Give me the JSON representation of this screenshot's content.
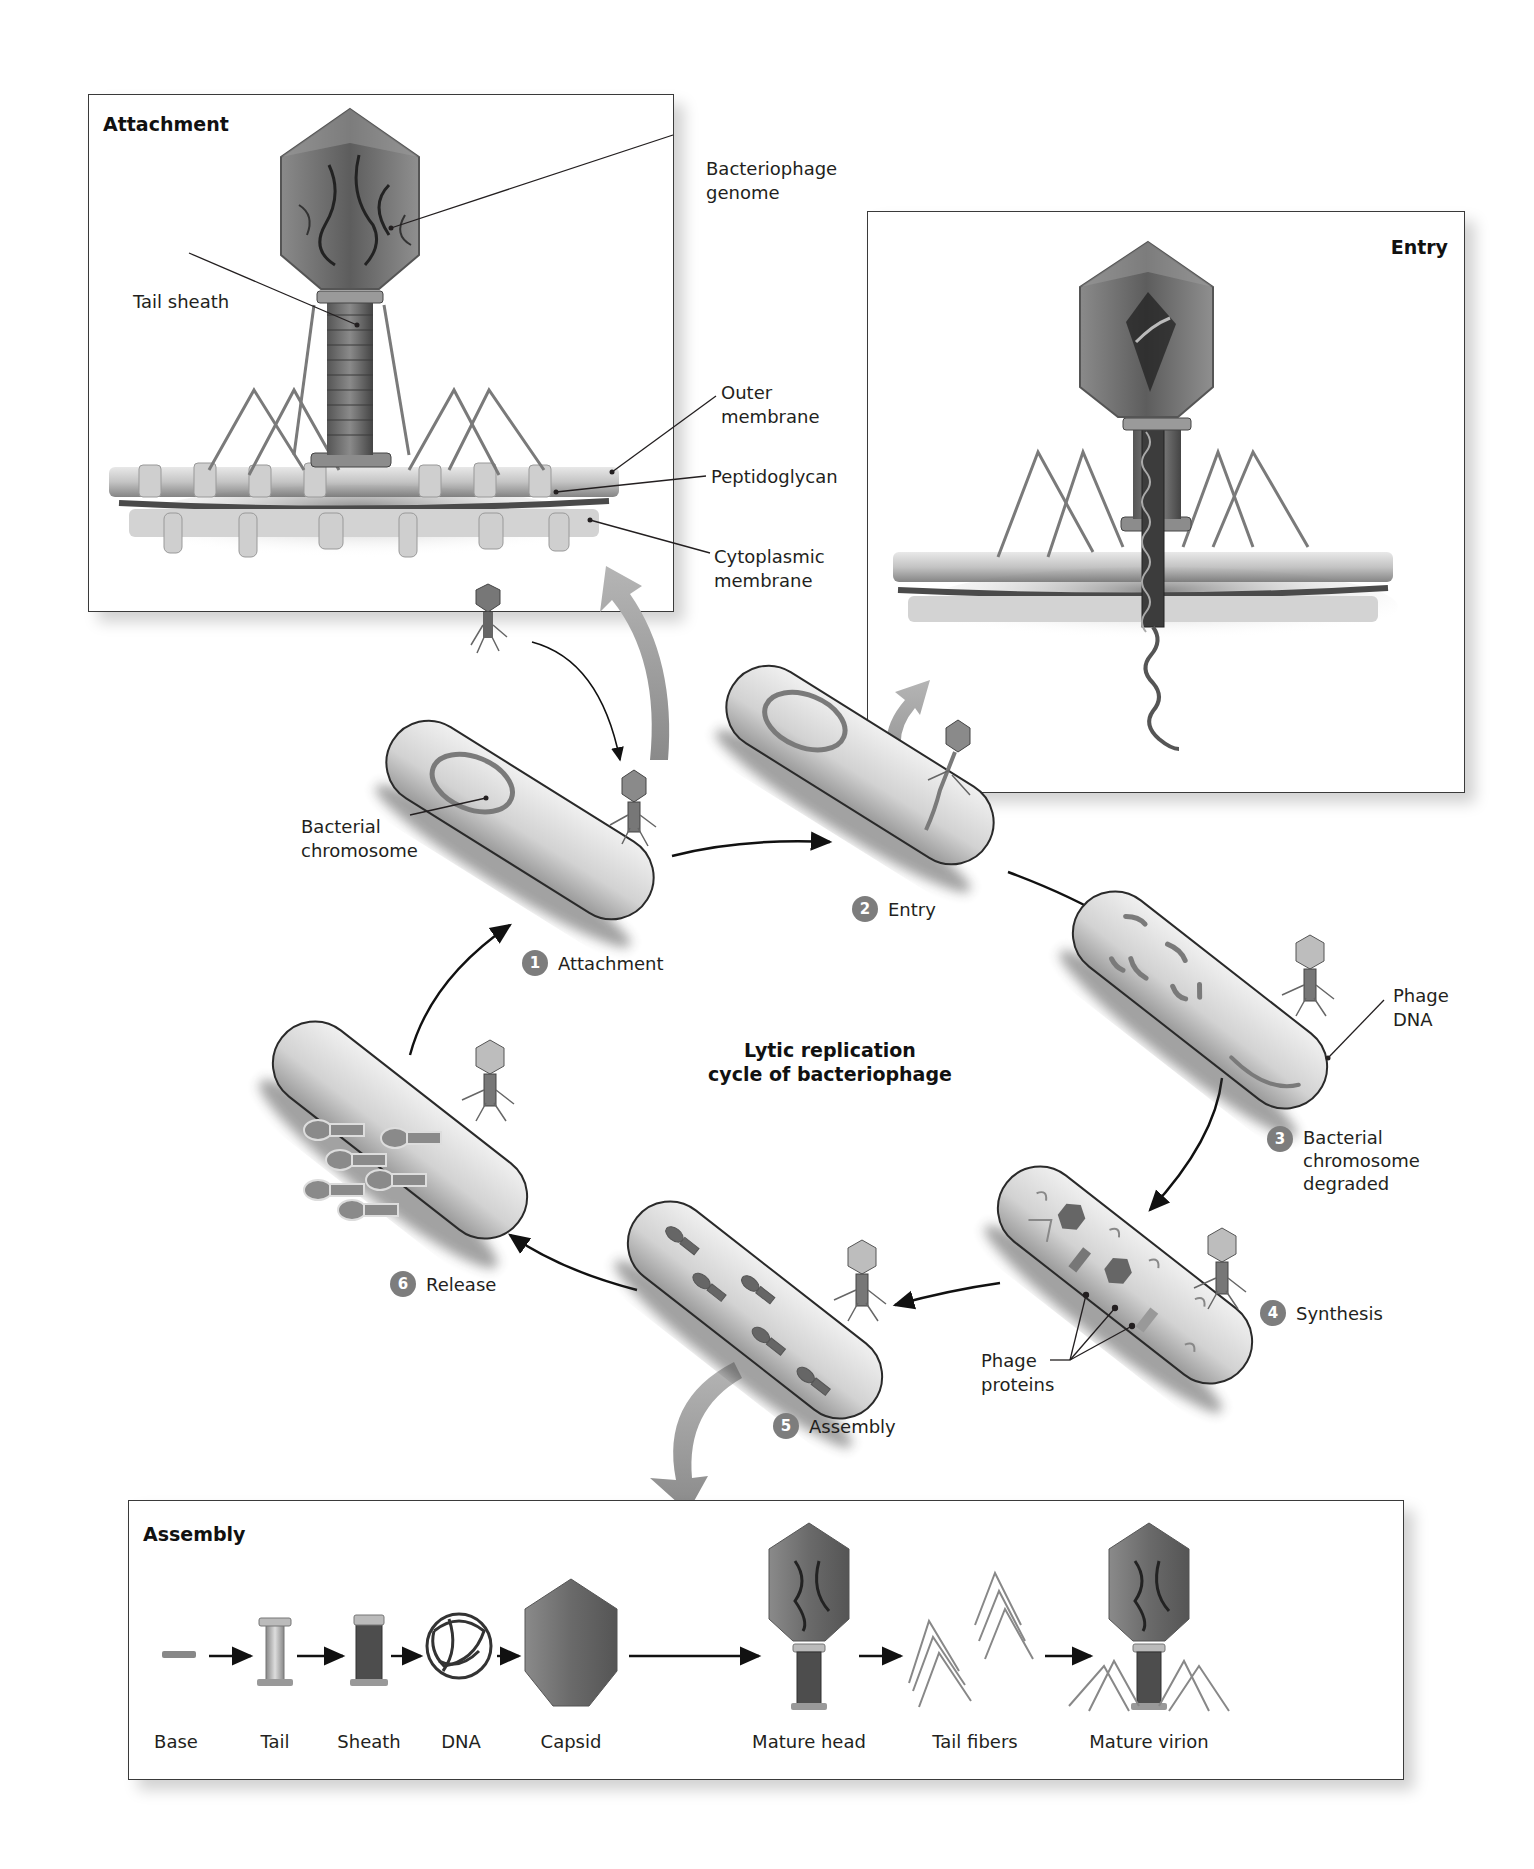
{
  "title": "Lytic replication cycle of bacteriophage",
  "title_lines": [
    "Lytic replication",
    "cycle of bacteriophage"
  ],
  "colors": {
    "step_badge": "#7d7d7d",
    "panel_border": "#3a3a3a",
    "text": "#231f20",
    "phage_head": "#6e6e6e",
    "chromosome": "#777777",
    "big_arrow": "#9a9a9a"
  },
  "panels": {
    "attachment": {
      "title": "Attachment",
      "labels": {
        "genome": [
          "Bacteriophage",
          "genome"
        ],
        "tail_sheath": "Tail sheath",
        "outer_membrane": [
          "Outer",
          "membrane"
        ],
        "peptidoglycan": "Peptidoglycan",
        "cytoplasmic_membrane": [
          "Cytoplasmic",
          "membrane"
        ]
      }
    },
    "entry": {
      "title": "Entry"
    },
    "assembly": {
      "title": "Assembly",
      "parts": [
        "Base",
        "Tail",
        "Sheath",
        "DNA",
        "Capsid",
        "Mature head",
        "Tail fibers",
        "Mature virion"
      ]
    }
  },
  "cycle": {
    "steps": [
      {
        "num": "1",
        "label": "Attachment"
      },
      {
        "num": "2",
        "label": "Entry"
      },
      {
        "num": "3",
        "label": [
          "Bacterial",
          "chromosome",
          "degraded"
        ]
      },
      {
        "num": "4",
        "label": "Synthesis"
      },
      {
        "num": "5",
        "label": "Assembly"
      },
      {
        "num": "6",
        "label": "Release"
      }
    ],
    "callouts": {
      "bacterial_chromosome": [
        "Bacterial",
        "chromosome"
      ],
      "phage_dna": [
        "Phage",
        "DNA"
      ],
      "phage_proteins": [
        "Phage",
        "proteins"
      ]
    }
  }
}
